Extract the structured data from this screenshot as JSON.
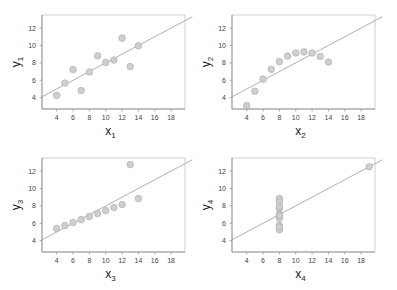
{
  "chart_data": [
    {
      "type": "scatter",
      "title": "",
      "xlabel": "x1",
      "ylabel": "y1",
      "xlabel_main": "x",
      "xlabel_sub": "1",
      "ylabel_main": "y",
      "ylabel_sub": "1",
      "xlim": [
        2.2,
        19.7
      ],
      "ylim": [
        2.7,
        13.5
      ],
      "xticks": [
        4,
        6,
        8,
        10,
        12,
        14,
        16,
        18
      ],
      "yticks": [
        4,
        6,
        8,
        10,
        12
      ],
      "x": [
        10,
        8,
        13,
        9,
        11,
        14,
        6,
        4,
        12,
        7,
        5
      ],
      "y": [
        8.04,
        6.95,
        7.58,
        8.81,
        8.33,
        9.96,
        7.24,
        4.26,
        10.84,
        4.82,
        5.68
      ],
      "fit_line": {
        "intercept": 3.0,
        "slope": 0.5
      },
      "grid": false
    },
    {
      "type": "scatter",
      "title": "",
      "xlabel": "x2",
      "ylabel": "y2",
      "xlabel_main": "x",
      "xlabel_sub": "2",
      "ylabel_main": "y",
      "ylabel_sub": "2",
      "xlim": [
        2.2,
        19.7
      ],
      "ylim": [
        2.7,
        13.5
      ],
      "xticks": [
        4,
        6,
        8,
        10,
        12,
        14,
        16,
        18
      ],
      "yticks": [
        4,
        6,
        8,
        10,
        12
      ],
      "x": [
        10,
        8,
        13,
        9,
        11,
        14,
        6,
        4,
        12,
        7,
        5
      ],
      "y": [
        9.14,
        8.14,
        8.74,
        8.77,
        9.26,
        8.1,
        6.13,
        3.1,
        9.13,
        7.26,
        4.74
      ],
      "fit_line": {
        "intercept": 3.0,
        "slope": 0.5
      },
      "grid": false
    },
    {
      "type": "scatter",
      "title": "",
      "xlabel": "x3",
      "ylabel": "y3",
      "xlabel_main": "x",
      "xlabel_sub": "3",
      "ylabel_main": "y",
      "ylabel_sub": "3",
      "xlim": [
        2.2,
        19.7
      ],
      "ylim": [
        2.7,
        13.5
      ],
      "xticks": [
        4,
        6,
        8,
        10,
        12,
        14,
        16,
        18
      ],
      "yticks": [
        4,
        6,
        8,
        10,
        12
      ],
      "x": [
        10,
        8,
        13,
        9,
        11,
        14,
        6,
        4,
        12,
        7,
        5
      ],
      "y": [
        7.46,
        6.77,
        12.74,
        7.11,
        7.81,
        8.84,
        6.08,
        5.39,
        8.15,
        6.42,
        5.73
      ],
      "fit_line": {
        "intercept": 3.0,
        "slope": 0.5
      },
      "grid": false
    },
    {
      "type": "scatter",
      "title": "",
      "xlabel": "x4",
      "ylabel": "y4",
      "xlabel_main": "x",
      "xlabel_sub": "4",
      "ylabel_main": "y",
      "ylabel_sub": "4",
      "xlim": [
        2.2,
        19.7
      ],
      "ylim": [
        2.7,
        13.5
      ],
      "xticks": [
        4,
        6,
        8,
        10,
        12,
        14,
        16,
        18
      ],
      "yticks": [
        4,
        6,
        8,
        10,
        12
      ],
      "x": [
        8,
        8,
        8,
        8,
        8,
        8,
        8,
        19,
        8,
        8,
        8
      ],
      "y": [
        6.58,
        5.76,
        7.71,
        8.84,
        8.47,
        7.04,
        5.25,
        12.5,
        5.56,
        7.91,
        6.89
      ],
      "fit_line": {
        "intercept": 3.0,
        "slope": 0.5
      },
      "grid": false
    }
  ],
  "style": {
    "point_fill": "#cfcfcf",
    "point_stroke": "#a8a8a8",
    "line_color": "#9a9a9a",
    "axis_color": "#888888"
  },
  "layout": {
    "panel_offsets": [
      [
        0,
        0
      ],
      [
        190,
        0
      ],
      [
        0,
        143
      ],
      [
        190,
        143
      ]
    ],
    "box": {
      "left": 42,
      "top": 15,
      "right": 185,
      "bottom": 109
    }
  }
}
